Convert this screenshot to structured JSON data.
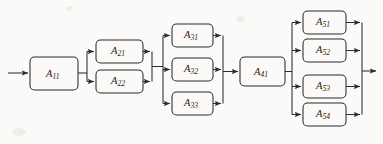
{
  "figure": {
    "kind": "reliability-block-diagram",
    "background_color": "#fbfaf8",
    "stroke_color": "#2b2b2b",
    "text_color": "#1d1d1d",
    "width": 383,
    "height": 144,
    "main_line_y": 73,
    "input_arrow": {
      "from_x": 8,
      "to_x": 30,
      "y": 73
    },
    "output_arrow": {
      "from_x": 362,
      "to_x": 378,
      "y": 71
    }
  },
  "blocks": [
    {
      "id": "A11",
      "base": "A",
      "sub": "11",
      "x": 30,
      "y": 57,
      "w": 48,
      "h": 33,
      "stage": 1
    },
    {
      "id": "A21",
      "base": "A",
      "sub": "21",
      "x": 96,
      "y": 40,
      "w": 47,
      "h": 23,
      "stage": 2
    },
    {
      "id": "A22",
      "base": "A",
      "sub": "22",
      "x": 96,
      "y": 70,
      "w": 47,
      "h": 23,
      "stage": 2
    },
    {
      "id": "A31",
      "base": "A",
      "sub": "31",
      "x": 172,
      "y": 24,
      "w": 41,
      "h": 23,
      "stage": 3
    },
    {
      "id": "A32",
      "base": "A",
      "sub": "32",
      "x": 172,
      "y": 58,
      "w": 41,
      "h": 23,
      "stage": 3
    },
    {
      "id": "A33",
      "base": "A",
      "sub": "33",
      "x": 172,
      "y": 92,
      "w": 41,
      "h": 23,
      "stage": 3
    },
    {
      "id": "A41",
      "base": "A",
      "sub": "41",
      "x": 240,
      "y": 57,
      "w": 45,
      "h": 29,
      "stage": 4
    },
    {
      "id": "A51",
      "base": "A",
      "sub": "51",
      "x": 303,
      "y": 11,
      "w": 43,
      "h": 23,
      "stage": 5
    },
    {
      "id": "A52",
      "base": "A",
      "sub": "52",
      "x": 303,
      "y": 39,
      "w": 43,
      "h": 23,
      "stage": 5
    },
    {
      "id": "A53",
      "base": "A",
      "sub": "53",
      "x": 303,
      "y": 75,
      "w": 43,
      "h": 23,
      "stage": 5
    },
    {
      "id": "A54",
      "base": "A",
      "sub": "54",
      "x": 303,
      "y": 103,
      "w": 43,
      "h": 23,
      "stage": 5
    }
  ],
  "buses": {
    "stage2_split_x": 87,
    "stage2_merge_x": 152,
    "stage3_split_x": 163,
    "stage3_merge_x": 223,
    "stage5_split_x": 292,
    "stage5_merge_x": 362
  }
}
